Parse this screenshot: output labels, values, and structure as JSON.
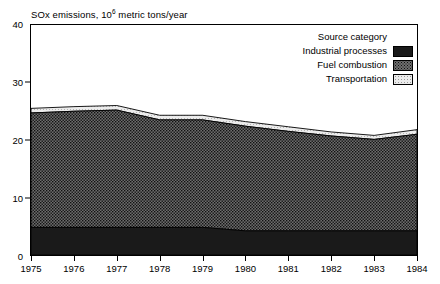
{
  "chart_data": {
    "type": "area",
    "stacked": true,
    "title_text_plain": "SOx emissions, 10",
    "title_exponent": "6",
    "title_tail": " metric tons/year",
    "xlabel": "",
    "ylabel": "",
    "x": [
      1975,
      1976,
      1977,
      1978,
      1979,
      1980,
      1981,
      1982,
      1983,
      1984
    ],
    "categories": [
      "1975",
      "1976",
      "1977",
      "1978",
      "1979",
      "1980",
      "1981",
      "1982",
      "1983",
      "1984"
    ],
    "xlim": [
      1975,
      1984
    ],
    "ylim": [
      0,
      40
    ],
    "yticks": [
      0,
      10,
      20,
      30,
      40
    ],
    "ytick_labels": [
      "0",
      "10",
      "20",
      "30",
      "40"
    ],
    "grid": false,
    "legend_position": "top-right",
    "legend_title": "Source category",
    "series": [
      {
        "name": "Industrial processes",
        "fill": "solid-black",
        "color": "#1a1a1a",
        "values": [
          4.8,
          4.8,
          4.8,
          4.8,
          4.8,
          4.2,
          4.2,
          4.2,
          4.2,
          4.2
        ]
      },
      {
        "name": "Fuel combustion",
        "fill": "dense-dotted",
        "color": "#6f6f6f",
        "values": [
          19.9,
          20.2,
          20.4,
          18.7,
          18.7,
          18.2,
          17.3,
          16.5,
          15.9,
          16.8
        ]
      },
      {
        "name": "Transportation",
        "fill": "light-dotted",
        "color": "#ebebeb",
        "values": [
          0.8,
          0.8,
          0.8,
          0.8,
          0.8,
          0.8,
          0.8,
          0.7,
          0.7,
          0.8
        ]
      }
    ],
    "totals": [
      25.5,
      25.8,
      26.0,
      24.3,
      24.3,
      23.2,
      22.3,
      21.4,
      20.8,
      21.8
    ],
    "annotations": []
  },
  "legend": {
    "title": "Source category",
    "items": [
      {
        "label": "Industrial processes",
        "swatch": "solid-black-swatch"
      },
      {
        "label": "Fuel combustion",
        "swatch": "dense-dotted-swatch"
      },
      {
        "label": "Transportation",
        "swatch": "light-dotted-swatch"
      }
    ]
  },
  "colors": {
    "industrial_processes": "#1a1a1a",
    "fuel_combustion": "#6f6f6f",
    "transportation": "#ebebeb",
    "axis": "#000000",
    "background": "#ffffff"
  }
}
